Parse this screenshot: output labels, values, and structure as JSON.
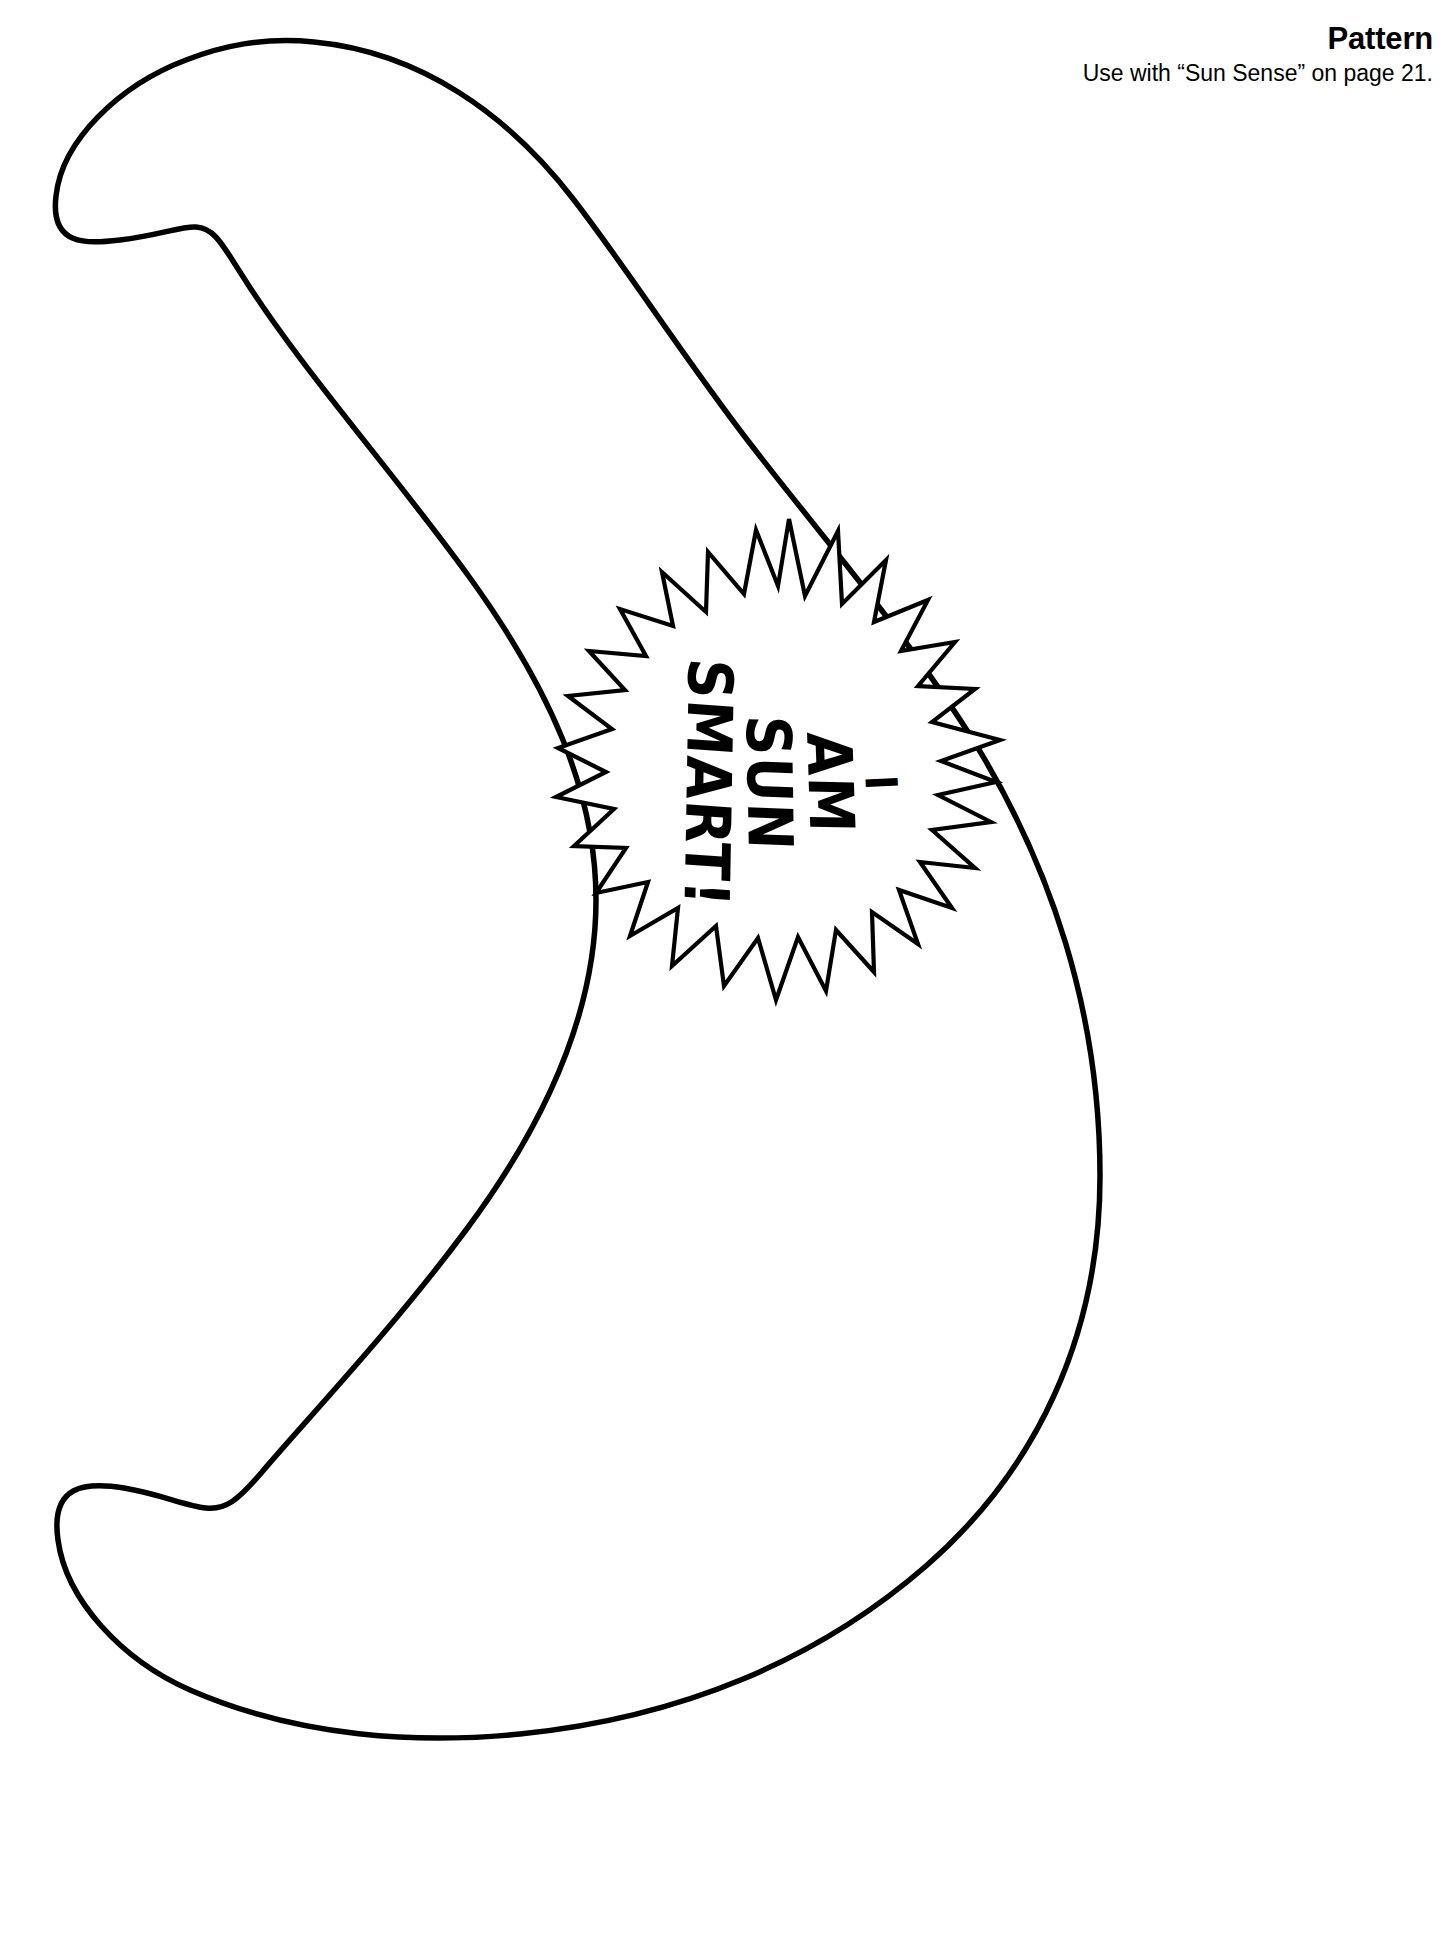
{
  "page": {
    "background_color": "#ffffff",
    "ink_color": "#000000",
    "width": 1449,
    "height": 1956
  },
  "header": {
    "title": "Pattern",
    "subtitle": "Use with “Sun Sense” on page 21."
  },
  "artwork": {
    "shape_name": "crescent-moon",
    "description": "Large crescent moon outline pattern, open toward the left",
    "fill": "#ffffff",
    "stroke": "#000000"
  },
  "badge": {
    "shape_name": "sunburst",
    "fill": "#ffffff",
    "stroke": "#000000",
    "rotation_degrees": 90,
    "lines": [
      "I",
      "AM",
      "SUN",
      "SMART!"
    ],
    "full_text": "I AM SUN SMART!"
  }
}
